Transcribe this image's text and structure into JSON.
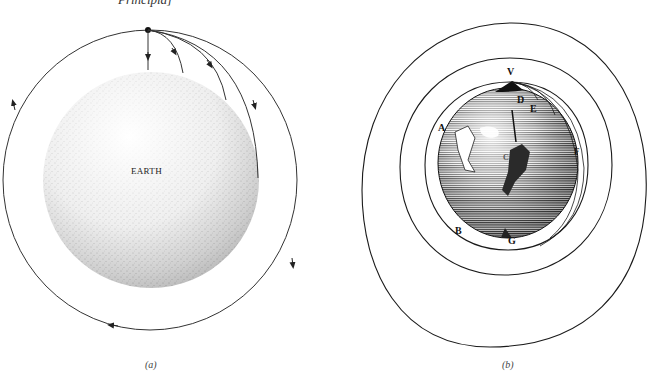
{
  "header": {
    "fragment": "Principia]"
  },
  "panels": [
    {
      "id": "a",
      "caption": "(a)",
      "body_label": "EARTH",
      "description": "Projectile launched horizontally from a mountain top with increasing speeds; final path is a circular orbit around Earth"
    },
    {
      "id": "b",
      "caption": "(b)",
      "point_labels": {
        "V": "V",
        "D": "D",
        "E": "E",
        "F": "F",
        "A": "A",
        "B": "B",
        "G": "G",
        "C": "C"
      },
      "description": "Newton's engraving of projectiles fired from mountain V landing at D, E, F, and orbiting paths"
    }
  ],
  "colors": {
    "line": "#222222",
    "stipple": "#555555",
    "engraving": "#1a1a1a",
    "background": "#ffffff"
  }
}
